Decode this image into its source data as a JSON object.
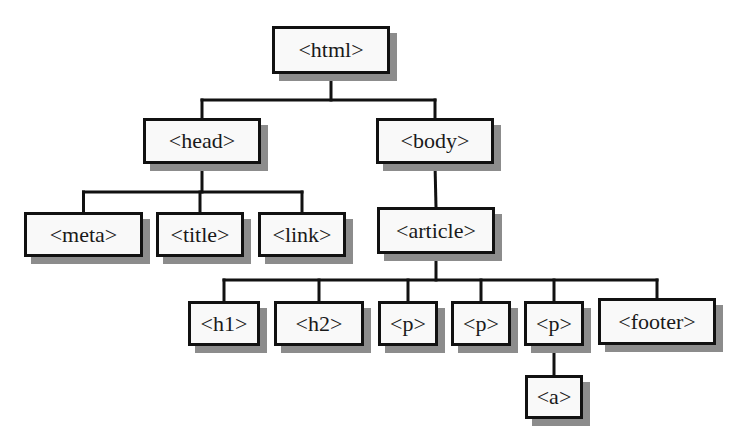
{
  "diagram": {
    "type": "tree",
    "colors": {
      "box_fill": "#f9f9f9",
      "border": "#111111",
      "shadow": "#8c8c8c",
      "text": "#1a1a1a"
    },
    "nodes": [
      {
        "id": "html",
        "label": "<html>",
        "parent": null,
        "x": 272,
        "y": 26,
        "w": 118,
        "h": 48
      },
      {
        "id": "head",
        "label": "<head>",
        "parent": "html",
        "x": 143,
        "y": 118,
        "w": 118,
        "h": 46
      },
      {
        "id": "body",
        "label": "<body>",
        "parent": "html",
        "x": 376,
        "y": 118,
        "w": 118,
        "h": 46
      },
      {
        "id": "meta",
        "label": "<meta>",
        "parent": "head",
        "x": 24,
        "y": 212,
        "w": 119,
        "h": 45
      },
      {
        "id": "title",
        "label": "<title>",
        "parent": "head",
        "x": 156,
        "y": 212,
        "w": 88,
        "h": 45
      },
      {
        "id": "link",
        "label": "<link>",
        "parent": "head",
        "x": 258,
        "y": 212,
        "w": 88,
        "h": 45
      },
      {
        "id": "article",
        "label": "<article>",
        "parent": "body",
        "x": 377,
        "y": 207,
        "w": 118,
        "h": 47
      },
      {
        "id": "h1",
        "label": "<h1>",
        "parent": "article",
        "x": 188,
        "y": 301,
        "w": 72,
        "h": 45
      },
      {
        "id": "h2",
        "label": "<h2>",
        "parent": "article",
        "x": 274,
        "y": 301,
        "w": 90,
        "h": 45
      },
      {
        "id": "p1",
        "label": "<p>",
        "parent": "article",
        "x": 378,
        "y": 301,
        "w": 60,
        "h": 45
      },
      {
        "id": "p2",
        "label": "<p>",
        "parent": "article",
        "x": 451,
        "y": 301,
        "w": 60,
        "h": 45
      },
      {
        "id": "p3",
        "label": "<p>",
        "parent": "article",
        "x": 524,
        "y": 301,
        "w": 60,
        "h": 45
      },
      {
        "id": "footer",
        "label": "<footer>",
        "parent": "article",
        "x": 598,
        "y": 298,
        "w": 118,
        "h": 47
      },
      {
        "id": "a",
        "label": "<a>",
        "parent": "p3",
        "x": 525,
        "y": 375,
        "w": 58,
        "h": 44
      }
    ]
  }
}
